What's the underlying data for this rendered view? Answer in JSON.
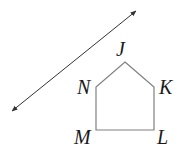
{
  "diagram": {
    "line": {
      "start": [
        12,
        111
      ],
      "end": [
        136,
        11
      ],
      "double_arrow": true,
      "color": "#333333"
    },
    "pentagon": {
      "stroke": "#808080",
      "vertices": [
        {
          "name": "J",
          "x": 125,
          "y": 62
        },
        {
          "name": "K",
          "x": 154,
          "y": 87
        },
        {
          "name": "L",
          "x": 154,
          "y": 130
        },
        {
          "name": "M",
          "x": 96,
          "y": 130
        },
        {
          "name": "N",
          "x": 96,
          "y": 87
        }
      ]
    },
    "labels": {
      "J": "J",
      "K": "K",
      "L": "L",
      "M": "M",
      "N": "N"
    }
  }
}
